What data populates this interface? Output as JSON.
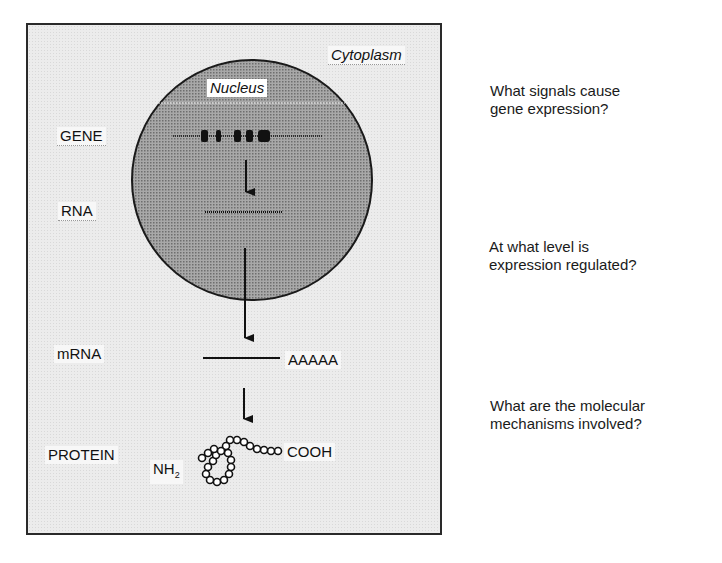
{
  "diagram": {
    "regions": {
      "cytoplasm": "Cytoplasm",
      "nucleus": "Nucleus"
    },
    "stages": [
      {
        "id": "gene",
        "label": "GENE"
      },
      {
        "id": "rna",
        "label": "RNA"
      },
      {
        "id": "mrna",
        "label": "mRNA",
        "tail": "AAAAA"
      },
      {
        "id": "protein",
        "label": "PROTEIN",
        "n_terminus": "NH",
        "n_terminus_sub": "2",
        "c_terminus": "COOH"
      }
    ],
    "questions": [
      {
        "line1": "What signals cause",
        "line2": "gene expression?"
      },
      {
        "line1": "At what level is",
        "line2": "expression regulated?"
      },
      {
        "line1": "What are the molecular",
        "line2": "mechanisms involved?"
      }
    ],
    "colors": {
      "nucleus_fill": "#9a9a9a",
      "cytoplasm_fill": "#ececec",
      "ink": "#111111"
    }
  }
}
